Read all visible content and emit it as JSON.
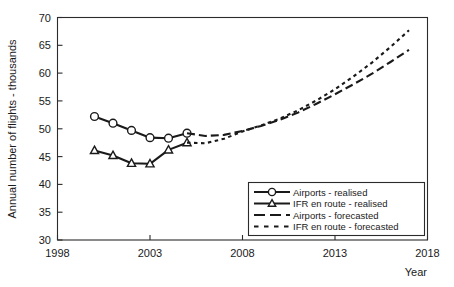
{
  "chart_data": {
    "type": "line",
    "title": "",
    "xlabel": "Year",
    "ylabel": "Annual number of flights - thousands",
    "xlim": [
      1998,
      2018
    ],
    "ylim": [
      30,
      70
    ],
    "xticks": [
      1998,
      2003,
      2008,
      2013,
      2018
    ],
    "yticks": [
      30,
      35,
      40,
      45,
      50,
      55,
      60,
      65,
      70
    ],
    "grid": false,
    "legend_position": "lower-right",
    "series": [
      {
        "name": "Airports - realised",
        "style": "solid",
        "marker": "circle",
        "x": [
          2000,
          2001,
          2002,
          2003,
          2004,
          2005
        ],
        "values": [
          52.2,
          51.0,
          49.7,
          48.4,
          48.3,
          49.2
        ]
      },
      {
        "name": "IFR en route - realised",
        "style": "solid",
        "marker": "triangle",
        "x": [
          2000,
          2001,
          2002,
          2003,
          2004,
          2005
        ],
        "values": [
          46.1,
          45.2,
          43.8,
          43.7,
          46.2,
          47.5
        ]
      },
      {
        "name": "Airports - forecasted",
        "style": "long-dash",
        "marker": "none",
        "x": [
          2005,
          2006,
          2007,
          2008,
          2009,
          2010,
          2011,
          2012,
          2013,
          2014,
          2015,
          2016,
          2017
        ],
        "values": [
          49.2,
          48.7,
          48.9,
          49.6,
          50.5,
          51.6,
          52.9,
          54.5,
          56.2,
          58.0,
          59.9,
          62.0,
          64.2
        ]
      },
      {
        "name": "IFR en route - forecasted",
        "style": "short-dash",
        "marker": "none",
        "x": [
          2005,
          2006,
          2007,
          2008,
          2009,
          2010,
          2011,
          2012,
          2013,
          2014,
          2015,
          2016,
          2017
        ],
        "values": [
          47.5,
          47.4,
          48.2,
          49.5,
          50.6,
          51.8,
          53.3,
          55.1,
          57.1,
          59.4,
          61.9,
          64.7,
          67.7
        ]
      }
    ],
    "legend_entries": [
      "Airports - realised",
      "IFR en route - realised",
      "Airports - forecasted",
      "IFR en route - forecasted"
    ],
    "colors": {
      "line": "#1a1a1a",
      "frame": "#2b2b2b",
      "marker_fill": "#ffffff",
      "background": "#ffffff"
    }
  },
  "axis": {
    "y_title": "Annual number of flights - thousands",
    "x_title": "Year",
    "y_ticks": [
      "70",
      "65",
      "60",
      "55",
      "50",
      "45",
      "40",
      "35",
      "30"
    ],
    "x_ticks": [
      "1998",
      "2003",
      "2008",
      "2013",
      "2018"
    ]
  },
  "legend": {
    "items": [
      {
        "label": "Airports - realised"
      },
      {
        "label": "IFR en route - realised"
      },
      {
        "label": "Airports - forecasted"
      },
      {
        "label": "IFR en route - forecasted"
      }
    ]
  }
}
